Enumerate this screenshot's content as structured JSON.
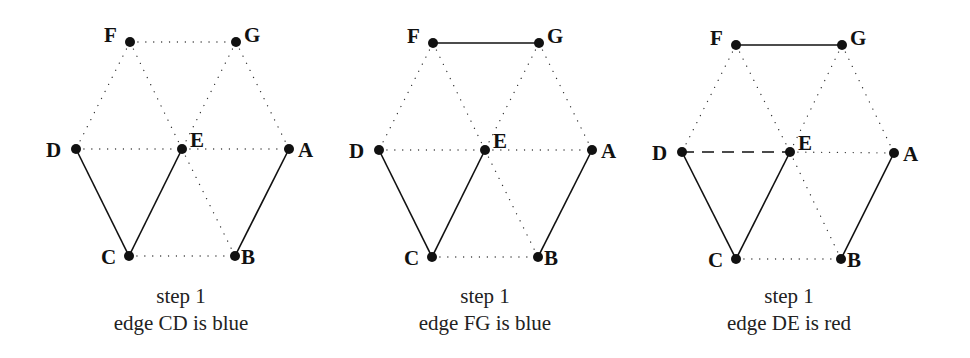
{
  "panels": [
    {
      "id": "panel-1",
      "caption": {
        "line1": "step 1",
        "line2": "edge CD is blue",
        "x": 181
      },
      "nodes": {
        "F": [
          130,
          42
        ],
        "G": [
          236,
          42
        ],
        "D": [
          76,
          149
        ],
        "E": [
          182,
          149
        ],
        "A": [
          289,
          149
        ],
        "C": [
          129,
          256
        ],
        "B": [
          235,
          256
        ]
      },
      "dotted_edges": [
        [
          "F",
          "G"
        ],
        [
          "F",
          "D"
        ],
        [
          "F",
          "E"
        ],
        [
          "G",
          "E"
        ],
        [
          "G",
          "A"
        ],
        [
          "D",
          "E"
        ],
        [
          "E",
          "A"
        ],
        [
          "E",
          "B"
        ],
        [
          "C",
          "B"
        ]
      ],
      "solid_edges": [
        [
          "D",
          "C"
        ],
        [
          "E",
          "C"
        ],
        [
          "A",
          "B"
        ]
      ],
      "dashed_edges": []
    },
    {
      "id": "panel-2",
      "caption": {
        "line1": "step 1",
        "line2": "edge FG is blue",
        "x": 485
      },
      "nodes": {
        "F": [
          433,
          43
        ],
        "G": [
          539,
          43
        ],
        "D": [
          379,
          150
        ],
        "E": [
          485,
          150
        ],
        "A": [
          592,
          150
        ],
        "C": [
          432,
          257
        ],
        "B": [
          538,
          257
        ]
      },
      "dotted_edges": [
        [
          "F",
          "D"
        ],
        [
          "F",
          "E"
        ],
        [
          "G",
          "E"
        ],
        [
          "G",
          "A"
        ],
        [
          "D",
          "E"
        ],
        [
          "E",
          "A"
        ],
        [
          "E",
          "B"
        ],
        [
          "C",
          "B"
        ]
      ],
      "solid_edges": [
        [
          "F",
          "G"
        ],
        [
          "D",
          "C"
        ],
        [
          "E",
          "C"
        ],
        [
          "A",
          "B"
        ]
      ],
      "dashed_edges": []
    },
    {
      "id": "panel-3",
      "caption": {
        "line1": "step 1",
        "line2": "edge DE is red",
        "x": 789
      },
      "nodes": {
        "F": [
          736,
          45
        ],
        "G": [
          842,
          45
        ],
        "D": [
          682,
          152
        ],
        "E": [
          790,
          152
        ],
        "A": [
          894,
          153
        ],
        "C": [
          736,
          259
        ],
        "B": [
          841,
          259
        ]
      },
      "dotted_edges": [
        [
          "F",
          "D"
        ],
        [
          "F",
          "E"
        ],
        [
          "G",
          "E"
        ],
        [
          "G",
          "A"
        ],
        [
          "E",
          "A"
        ],
        [
          "E",
          "B"
        ],
        [
          "C",
          "B"
        ]
      ],
      "solid_edges": [
        [
          "F",
          "G"
        ],
        [
          "D",
          "C"
        ],
        [
          "E",
          "C"
        ],
        [
          "A",
          "B"
        ]
      ],
      "dashed_edges": [
        [
          "D",
          "E"
        ]
      ]
    }
  ],
  "label_offsets": {
    "F": [
      -26,
      0
    ],
    "G": [
      8,
      0
    ],
    "D": [
      -30,
      8
    ],
    "E": [
      8,
      -2
    ],
    "A": [
      9,
      8
    ],
    "C": [
      -28,
      8
    ],
    "B": [
      6,
      8
    ]
  },
  "legend": {
    "solid": "blue edge",
    "dashed": "red edge",
    "dotted": "uncolored edge"
  }
}
